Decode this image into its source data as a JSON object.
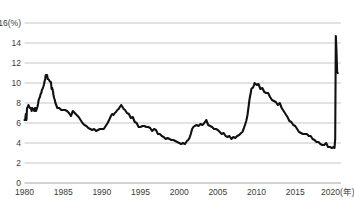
{
  "chart_data": {
    "type": "line",
    "title": "",
    "subtitle": "",
    "xlabel": "年",
    "ylabel": "%",
    "unit_label": "16(%)",
    "xlim": [
      1980,
      2020.92
    ],
    "ylim": [
      0,
      16
    ],
    "grid": true,
    "legend": "none",
    "y_ticks": [
      0,
      2,
      4,
      6,
      8,
      10,
      12,
      14,
      16
    ],
    "y_tick_labels": [
      "0",
      "2",
      "4",
      "6",
      "8",
      "10",
      "12",
      "14",
      "16"
    ],
    "x_ticks": [
      1980,
      1985,
      1990,
      1995,
      2000,
      2005,
      2010,
      2015,
      2020
    ],
    "x_tick_labels": [
      "1980",
      "1985",
      "1990",
      "1995",
      "2000",
      "2005",
      "2010",
      "2015",
      "2020(年)"
    ],
    "series": [
      {
        "name": "失業率",
        "color": "#111111",
        "x": [
          1980.0,
          1980.08,
          1980.17,
          1980.25,
          1980.33,
          1980.42,
          1980.5,
          1980.58,
          1980.67,
          1980.75,
          1980.83,
          1980.92,
          1981.0,
          1981.08,
          1981.17,
          1981.25,
          1981.33,
          1981.42,
          1981.5,
          1981.58,
          1981.67,
          1981.75,
          1981.83,
          1981.92,
          1982.0,
          1982.08,
          1982.17,
          1982.25,
          1982.33,
          1982.42,
          1982.5,
          1982.58,
          1982.67,
          1982.75,
          1982.83,
          1982.92,
          1983.0,
          1983.08,
          1983.17,
          1983.25,
          1983.33,
          1983.42,
          1983.5,
          1983.58,
          1983.67,
          1983.75,
          1983.83,
          1983.92,
          1984.0,
          1984.25,
          1984.5,
          1984.75,
          1985.0,
          1985.25,
          1985.5,
          1985.75,
          1986.0,
          1986.25,
          1986.5,
          1986.75,
          1987.0,
          1987.25,
          1987.5,
          1987.75,
          1988.0,
          1988.25,
          1988.5,
          1988.75,
          1989.0,
          1989.25,
          1989.5,
          1989.75,
          1990.0,
          1990.25,
          1990.5,
          1990.75,
          1991.0,
          1991.17,
          1991.33,
          1991.5,
          1991.67,
          1991.83,
          1992.0,
          1992.17,
          1992.33,
          1992.5,
          1992.67,
          1992.83,
          1993.0,
          1993.25,
          1993.5,
          1993.75,
          1994.0,
          1994.25,
          1994.5,
          1994.75,
          1995.0,
          1995.25,
          1995.5,
          1995.75,
          1996.0,
          1996.25,
          1996.5,
          1996.75,
          1997.0,
          1997.25,
          1997.5,
          1997.75,
          1998.0,
          1998.25,
          1998.5,
          1998.75,
          1999.0,
          1999.25,
          1999.5,
          1999.75,
          2000.0,
          2000.25,
          2000.5,
          2000.75,
          2001.0,
          2001.17,
          2001.33,
          2001.5,
          2001.67,
          2001.83,
          2002.0,
          2002.25,
          2002.5,
          2002.75,
          2003.0,
          2003.25,
          2003.5,
          2003.75,
          2004.0,
          2004.25,
          2004.5,
          2004.75,
          2005.0,
          2005.25,
          2005.5,
          2005.75,
          2006.0,
          2006.25,
          2006.5,
          2006.75,
          2007.0,
          2007.25,
          2007.5,
          2007.75,
          2008.0,
          2008.17,
          2008.33,
          2008.5,
          2008.67,
          2008.83,
          2009.0,
          2009.08,
          2009.17,
          2009.25,
          2009.33,
          2009.42,
          2009.5,
          2009.58,
          2009.67,
          2009.75,
          2009.83,
          2009.92,
          2010.0,
          2010.08,
          2010.17,
          2010.25,
          2010.5,
          2010.75,
          2011.0,
          2011.25,
          2011.5,
          2011.75,
          2012.0,
          2012.25,
          2012.5,
          2012.75,
          2013.0,
          2013.25,
          2013.5,
          2013.75,
          2014.0,
          2014.25,
          2014.5,
          2014.75,
          2015.0,
          2015.25,
          2015.5,
          2015.75,
          2016.0,
          2016.25,
          2016.5,
          2016.75,
          2017.0,
          2017.25,
          2017.5,
          2017.75,
          2018.0,
          2018.25,
          2018.5,
          2018.75,
          2019.0,
          2019.25,
          2019.5,
          2019.75,
          2020.0,
          2020.08,
          2020.17,
          2020.25,
          2020.33,
          2020.42,
          2020.5
        ],
        "values": [
          6.3,
          6.3,
          6.9,
          6.3,
          7.5,
          7.6,
          7.8,
          7.7,
          7.5,
          7.5,
          7.5,
          7.2,
          7.5,
          7.4,
          7.4,
          7.2,
          7.5,
          7.5,
          7.2,
          7.4,
          7.6,
          7.9,
          8.3,
          8.5,
          8.6,
          8.9,
          9.0,
          9.3,
          9.4,
          9.6,
          9.8,
          10.1,
          10.4,
          10.8,
          10.8,
          10.8,
          10.4,
          10.4,
          10.3,
          10.2,
          10.1,
          10.1,
          9.4,
          9.5,
          9.2,
          8.8,
          8.5,
          8.3,
          8.0,
          7.5,
          7.5,
          7.3,
          7.3,
          7.3,
          7.2,
          7.0,
          6.7,
          7.2,
          7.0,
          6.8,
          6.6,
          6.3,
          6.0,
          5.8,
          5.7,
          5.5,
          5.4,
          5.3,
          5.4,
          5.2,
          5.3,
          5.4,
          5.4,
          5.4,
          5.7,
          6.0,
          6.4,
          6.7,
          6.9,
          6.8,
          7.0,
          7.1,
          7.3,
          7.4,
          7.6,
          7.8,
          7.6,
          7.4,
          7.3,
          7.0,
          6.9,
          6.5,
          6.6,
          6.1,
          6.0,
          5.6,
          5.6,
          5.7,
          5.7,
          5.6,
          5.6,
          5.5,
          5.2,
          5.4,
          5.3,
          4.9,
          4.9,
          4.7,
          4.6,
          4.4,
          4.5,
          4.4,
          4.3,
          4.3,
          4.2,
          4.1,
          4.0,
          3.9,
          4.0,
          3.9,
          4.2,
          4.3,
          4.5,
          4.9,
          5.4,
          5.6,
          5.7,
          5.8,
          5.7,
          5.9,
          5.8,
          6.0,
          6.3,
          5.8,
          5.7,
          5.6,
          5.4,
          5.4,
          5.3,
          5.1,
          4.9,
          5.0,
          4.7,
          4.6,
          4.7,
          4.4,
          4.6,
          4.5,
          4.7,
          4.8,
          5.0,
          5.1,
          5.4,
          5.8,
          6.2,
          6.8,
          7.8,
          8.3,
          8.7,
          9.0,
          9.4,
          9.5,
          9.5,
          9.6,
          9.8,
          10.0,
          9.9,
          9.9,
          9.8,
          9.8,
          9.9,
          9.9,
          9.4,
          9.5,
          9.1,
          9.0,
          9.0,
          8.6,
          8.3,
          8.2,
          8.1,
          7.8,
          8.0,
          7.5,
          7.2,
          6.9,
          6.6,
          6.2,
          6.1,
          5.8,
          5.7,
          5.4,
          5.1,
          5.0,
          4.9,
          4.9,
          4.9,
          4.7,
          4.7,
          4.4,
          4.3,
          4.1,
          4.1,
          3.9,
          3.8,
          3.8,
          4.0,
          3.6,
          3.6,
          3.5,
          3.6,
          3.5,
          4.4,
          14.7,
          13.3,
          11.1,
          11.0
        ]
      }
    ],
    "annotations": [
      {
        "label": "1982年ピーク",
        "x": 1982.75,
        "y": 10.8
      },
      {
        "label": "1992年ピーク",
        "x": 1992.5,
        "y": 7.8
      },
      {
        "label": "2009-2010年ピーク",
        "x": 2009.75,
        "y": 10.0
      },
      {
        "label": "2000年の底",
        "x": 2000.25,
        "y": 3.9
      },
      {
        "label": "2020年コロナ急騰",
        "x": 2020.25,
        "y": 14.7
      }
    ]
  }
}
